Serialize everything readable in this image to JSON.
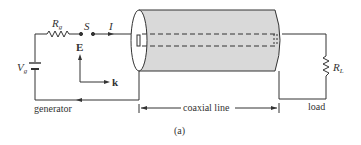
{
  "figure": {
    "caption": "(a)",
    "colors": {
      "line": "#333333",
      "cable_fill": "#d9d9d9",
      "background": "#ffffff"
    }
  },
  "generator": {
    "label": "generator",
    "source_label": "V",
    "source_sub": "g",
    "resistor_label": "R",
    "resistor_sub": "g",
    "switch_label": "S",
    "current_label": "I"
  },
  "field_axes": {
    "e_label": "E",
    "k_label": "k"
  },
  "coax": {
    "label": "coaxial line"
  },
  "load": {
    "label": "load",
    "resistor_label": "R",
    "resistor_sub": "L"
  }
}
